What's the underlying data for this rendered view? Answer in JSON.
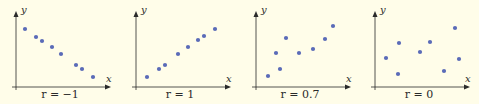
{
  "colors": {
    "background": "#fffde9",
    "point": "#5a6bb8",
    "axis": "#2a2a2a"
  },
  "chart_data": [
    {
      "type": "scatter",
      "title": "",
      "caption": "r = −1",
      "xlabel": "x",
      "ylabel": "y",
      "grid": false,
      "points": [
        [
          25,
          29
        ],
        [
          36,
          37
        ],
        [
          42,
          41
        ],
        [
          52,
          47
        ],
        [
          61,
          54
        ],
        [
          76,
          65
        ],
        [
          82,
          69
        ],
        [
          93,
          77
        ]
      ]
    },
    {
      "type": "scatter",
      "title": "",
      "caption": "r = 1",
      "xlabel": "x",
      "ylabel": "y",
      "grid": false,
      "points": [
        [
          27,
          77
        ],
        [
          39,
          69
        ],
        [
          45,
          65
        ],
        [
          58,
          54
        ],
        [
          68,
          47
        ],
        [
          78,
          40
        ],
        [
          84,
          36
        ],
        [
          95,
          29
        ]
      ]
    },
    {
      "type": "scatter",
      "title": "",
      "caption": "r = 0.7",
      "xlabel": "x",
      "ylabel": "y",
      "grid": false,
      "points": [
        [
          28,
          76
        ],
        [
          36,
          53
        ],
        [
          40,
          69
        ],
        [
          46,
          38
        ],
        [
          59,
          53
        ],
        [
          73,
          49
        ],
        [
          85,
          39
        ],
        [
          93,
          26
        ]
      ]
    },
    {
      "type": "scatter",
      "title": "",
      "caption": "r = 0",
      "xlabel": "x",
      "ylabel": "y",
      "grid": false,
      "points": [
        [
          27,
          58
        ],
        [
          40,
          43
        ],
        [
          39,
          74
        ],
        [
          61,
          52
        ],
        [
          71,
          42
        ],
        [
          85,
          71
        ],
        [
          96,
          28
        ],
        [
          100,
          59
        ]
      ]
    }
  ]
}
